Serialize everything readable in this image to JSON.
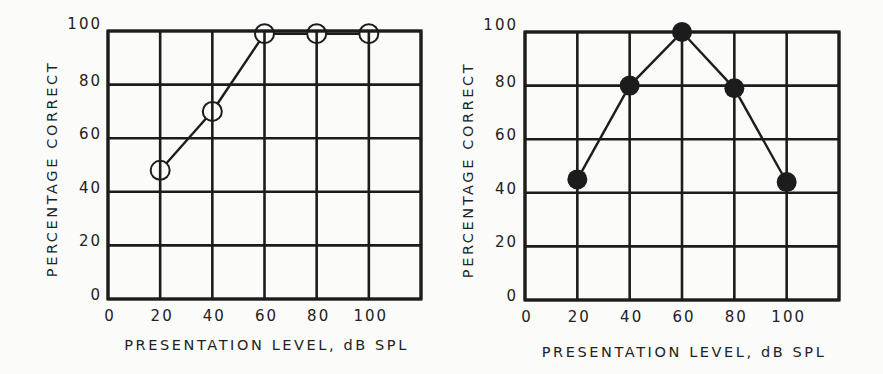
{
  "chart_data": [
    {
      "type": "line",
      "panel": "left",
      "marker": "open-circle",
      "title": "",
      "xlabel": "PRESENTATION LEVEL, dB SPL",
      "ylabel": "PERCENTAGE CORRECT",
      "x_ticks": [
        "0",
        "20",
        "40",
        "60",
        "80",
        "100"
      ],
      "y_ticks": [
        "0",
        "20",
        "40",
        "60",
        "80",
        "100"
      ],
      "xlim": [
        0,
        120
      ],
      "ylim": [
        0,
        100
      ],
      "grid": true,
      "legend": null,
      "series": [
        {
          "name": "open circles",
          "x": [
            20,
            40,
            60,
            80,
            100
          ],
          "values": [
            48,
            70,
            99,
            99,
            99
          ]
        }
      ]
    },
    {
      "type": "line",
      "panel": "right",
      "marker": "filled-circle",
      "title": "",
      "xlabel": "PRESENTATION LEVEL, dB SPL",
      "ylabel": "PERCENTAGE CORRECT",
      "x_ticks": [
        "0",
        "20",
        "40",
        "60",
        "80",
        "100"
      ],
      "y_ticks": [
        "0",
        "20",
        "40",
        "60",
        "80",
        "100"
      ],
      "xlim": [
        0,
        120
      ],
      "ylim": [
        0,
        100
      ],
      "grid": true,
      "legend": null,
      "series": [
        {
          "name": "filled circles",
          "x": [
            20,
            40,
            60,
            80,
            100
          ],
          "values": [
            45,
            80,
            100,
            79,
            44
          ]
        }
      ]
    }
  ],
  "colors": {
    "ink": "#1c1c1c",
    "background": "#fbfbfa"
  }
}
